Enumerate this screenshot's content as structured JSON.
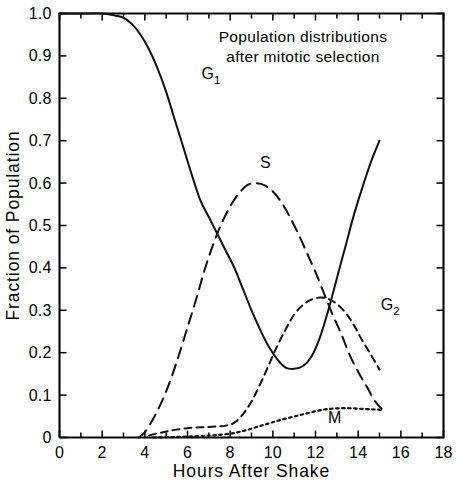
{
  "chart_data": {
    "type": "line",
    "title_lines": [
      "Population distributions",
      "after mitotic selection"
    ],
    "xlabel": "Hours After Shake",
    "ylabel": "Fraction of Population",
    "xlim": [
      0,
      18
    ],
    "ylim": [
      0,
      1.0
    ],
    "grid": false,
    "legend_position": "inline-curve-labels",
    "x_ticks_major": [
      0,
      2,
      4,
      6,
      8,
      10,
      12,
      14,
      16,
      18
    ],
    "x_tick_labels": [
      "0",
      "2",
      "4",
      "6",
      "8",
      "10",
      "12",
      "14",
      "16",
      "18"
    ],
    "x_ticks_minor": [
      1,
      3,
      5,
      7,
      9,
      11,
      13,
      15,
      17
    ],
    "y_ticks_major": [
      0,
      0.1,
      0.2,
      0.3,
      0.4,
      0.5,
      0.6,
      0.7,
      0.8,
      0.9,
      1.0
    ],
    "y_tick_labels": [
      "0",
      "0.1",
      "0.2",
      "0.3",
      "0.4",
      "0.5",
      "0.6",
      "0.7",
      "0.8",
      "0.9",
      "1.0"
    ],
    "series": [
      {
        "name": "G1",
        "label": "G",
        "label_sub": "1",
        "line_style": "solid",
        "x": [
          0.0,
          1.0,
          2.0,
          2.6,
          3.0,
          3.4,
          3.8,
          4.2,
          4.6,
          5.0,
          5.4,
          5.8,
          6.2,
          6.6,
          7.0,
          7.4,
          7.8,
          8.2,
          8.6,
          9.0,
          9.4,
          9.8,
          10.2,
          10.6,
          11.0,
          11.4,
          11.8,
          12.2,
          12.6,
          13.0,
          13.4,
          13.8,
          14.2,
          14.6,
          15.0
        ],
        "y": [
          1.0,
          1.0,
          1.0,
          0.995,
          0.99,
          0.975,
          0.95,
          0.915,
          0.87,
          0.815,
          0.75,
          0.685,
          0.62,
          0.56,
          0.52,
          0.48,
          0.44,
          0.4,
          0.35,
          0.3,
          0.255,
          0.215,
          0.185,
          0.165,
          0.162,
          0.168,
          0.19,
          0.235,
          0.3,
          0.375,
          0.45,
          0.525,
          0.59,
          0.65,
          0.7
        ]
      },
      {
        "name": "S",
        "label": "S",
        "label_sub": "",
        "line_style": "long-dash",
        "x": [
          3.7,
          4.0,
          4.4,
          4.8,
          5.2,
          5.6,
          6.0,
          6.4,
          6.8,
          7.2,
          7.6,
          8.0,
          8.4,
          8.8,
          9.2,
          9.6,
          10.0,
          10.4,
          10.8,
          11.2,
          11.6,
          12.0,
          12.4,
          12.8,
          13.2,
          13.6,
          14.0,
          14.4,
          14.8,
          15.1
        ],
        "y": [
          0.0,
          0.012,
          0.045,
          0.085,
          0.135,
          0.195,
          0.26,
          0.325,
          0.395,
          0.455,
          0.505,
          0.545,
          0.575,
          0.595,
          0.6,
          0.595,
          0.58,
          0.555,
          0.52,
          0.48,
          0.435,
          0.39,
          0.34,
          0.29,
          0.245,
          0.195,
          0.155,
          0.12,
          0.085,
          0.068
        ]
      },
      {
        "name": "G2",
        "label": "G",
        "label_sub": "2",
        "line_style": "dash",
        "x": [
          4.2,
          4.8,
          5.4,
          6.0,
          6.6,
          7.0,
          7.4,
          7.8,
          8.2,
          8.6,
          9.0,
          9.4,
          9.8,
          10.2,
          10.6,
          11.0,
          11.4,
          11.8,
          12.2,
          12.6,
          13.0,
          13.4,
          13.8,
          14.2,
          14.6,
          15.0
        ],
        "y": [
          0.005,
          0.012,
          0.018,
          0.022,
          0.024,
          0.025,
          0.026,
          0.028,
          0.035,
          0.055,
          0.085,
          0.125,
          0.17,
          0.215,
          0.255,
          0.29,
          0.312,
          0.325,
          0.33,
          0.327,
          0.315,
          0.295,
          0.265,
          0.228,
          0.195,
          0.16
        ]
      },
      {
        "name": "M",
        "label": "M",
        "label_sub": "",
        "line_style": "dot",
        "x": [
          4.4,
          5.2,
          6.0,
          6.8,
          7.4,
          8.0,
          8.4,
          8.8,
          9.2,
          9.6,
          10.0,
          10.4,
          10.8,
          11.2,
          11.6,
          12.0,
          12.4,
          12.8,
          13.2,
          13.6,
          14.0,
          14.4,
          14.8,
          15.1
        ],
        "y": [
          0.0,
          0.001,
          0.002,
          0.004,
          0.006,
          0.009,
          0.013,
          0.018,
          0.024,
          0.03,
          0.036,
          0.042,
          0.047,
          0.052,
          0.057,
          0.062,
          0.066,
          0.068,
          0.069,
          0.069,
          0.068,
          0.067,
          0.066,
          0.065
        ]
      }
    ],
    "annotations": [
      {
        "text": "G",
        "sub": "1",
        "x": 7.1,
        "y": 0.845
      },
      {
        "text": "S",
        "sub": "",
        "x": 9.65,
        "y": 0.635
      },
      {
        "text": "G",
        "sub": "2",
        "x": 15.5,
        "y": 0.3
      },
      {
        "text": "M",
        "sub": "",
        "x": 12.9,
        "y": 0.035
      }
    ],
    "colors": {
      "ink": "#000000",
      "background": "#ffffff"
    }
  },
  "figure": {
    "caption": ""
  }
}
